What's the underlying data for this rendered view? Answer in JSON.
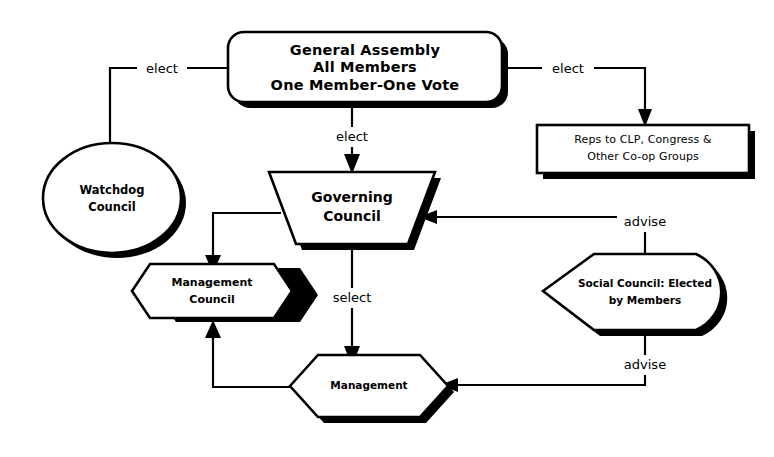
{
  "diagram": {
    "colors": {
      "line": "#000000",
      "fill": "#ffffff",
      "shadow": "#000000"
    },
    "nodes": [
      {
        "id": "general-assembly",
        "shape": "rounded-rectangle",
        "lines": [
          "General Assembly",
          "All Members",
          "One Member-One Vote"
        ]
      },
      {
        "id": "watchdog-council",
        "shape": "ellipse",
        "lines": [
          "Watchdog",
          "Council"
        ]
      },
      {
        "id": "reps-group",
        "shape": "rectangle",
        "lines": [
          "Reps to CLP, Congress &",
          "Other Co-op Groups"
        ]
      },
      {
        "id": "governing-council",
        "shape": "inverted-trapezoid",
        "lines": [
          "Governing",
          "Council"
        ]
      },
      {
        "id": "management-council",
        "shape": "hexagon",
        "lines": [
          "Management",
          "Council"
        ]
      },
      {
        "id": "management",
        "shape": "hexagon",
        "lines": [
          "Management"
        ]
      },
      {
        "id": "social-council",
        "shape": "flag-pointed-left",
        "lines": [
          "Social Council: Elected",
          "by Members"
        ]
      }
    ],
    "edges": [
      {
        "id": "ga-to-watchdog",
        "from": "general-assembly",
        "to": "watchdog-council",
        "label": "elect"
      },
      {
        "id": "ga-to-reps",
        "from": "general-assembly",
        "to": "reps-group",
        "label": "elect"
      },
      {
        "id": "ga-to-governing",
        "from": "general-assembly",
        "to": "governing-council",
        "label": "elect"
      },
      {
        "id": "governing-to-management-council",
        "from": "governing-council",
        "to": "management-council",
        "label": ""
      },
      {
        "id": "governing-to-management",
        "from": "governing-council",
        "to": "management",
        "label": "select"
      },
      {
        "id": "management-to-management-council",
        "from": "management",
        "to": "management-council",
        "label": ""
      },
      {
        "id": "social-to-governing",
        "from": "social-council",
        "to": "governing-council",
        "label": "advise"
      },
      {
        "id": "social-to-management",
        "from": "social-council",
        "to": "management",
        "label": "advise"
      }
    ]
  }
}
